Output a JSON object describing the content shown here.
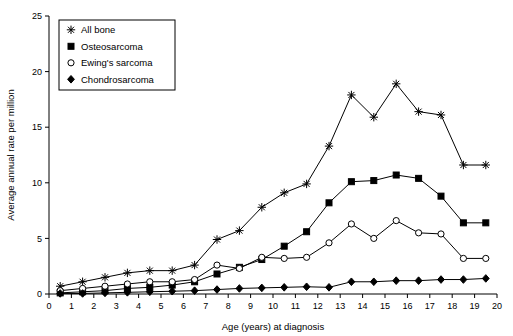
{
  "chart_data": {
    "type": "line",
    "title": "",
    "xlabel": "Age (years) at diagnosis",
    "ylabel": "Average annual rate per million",
    "xlim": [
      0,
      20
    ],
    "ylim": [
      0,
      25
    ],
    "xticks": [
      "0",
      "1",
      "2",
      "3",
      "4",
      "5",
      "6",
      "7",
      "8",
      "9",
      "10",
      "11",
      "12",
      "13",
      "14",
      "15",
      "16",
      "17",
      "18",
      "19",
      "20"
    ],
    "yticks": [
      "0",
      "5",
      "10",
      "15",
      "20",
      "25"
    ],
    "grid": false,
    "legend_position": "top-left",
    "x": [
      0.5,
      1.5,
      2.5,
      3.5,
      4.5,
      5.5,
      6.5,
      7.5,
      8.5,
      9.5,
      10.5,
      11.5,
      12.5,
      13.5,
      14.5,
      15.5,
      16.5,
      17.5,
      18.5,
      19.5
    ],
    "series": [
      {
        "name": "All bone",
        "marker": "plus-star",
        "values": [
          0.7,
          1.1,
          1.5,
          1.9,
          2.1,
          2.1,
          2.6,
          4.9,
          5.7,
          7.8,
          9.1,
          9.9,
          13.3,
          17.9,
          15.9,
          18.9,
          16.4,
          16.1,
          11.6,
          11.6
        ]
      },
      {
        "name": "Osteosarcoma",
        "marker": "filled-square",
        "values": [
          0.1,
          0.2,
          0.3,
          0.5,
          0.6,
          0.8,
          1.1,
          1.8,
          2.4,
          3.1,
          4.3,
          5.6,
          8.2,
          10.1,
          10.2,
          10.7,
          10.4,
          8.8,
          6.4,
          6.4
        ]
      },
      {
        "name": "Ewing's sarcoma",
        "marker": "open-circle",
        "values": [
          0.3,
          0.5,
          0.7,
          0.9,
          1.1,
          1.1,
          1.3,
          2.6,
          2.3,
          3.3,
          3.2,
          3.3,
          4.6,
          6.3,
          5.0,
          6.6,
          5.5,
          5.4,
          3.2,
          3.2
        ]
      },
      {
        "name": "Chondrosarcoma",
        "marker": "filled-diamond",
        "values": [
          0.05,
          0.05,
          0.1,
          0.15,
          0.2,
          0.25,
          0.3,
          0.4,
          0.5,
          0.55,
          0.6,
          0.65,
          0.6,
          1.1,
          1.1,
          1.2,
          1.2,
          1.3,
          1.3,
          1.4
        ]
      }
    ],
    "colors": {
      "line": "#000000",
      "axis": "#000000",
      "background": "#ffffff"
    }
  }
}
